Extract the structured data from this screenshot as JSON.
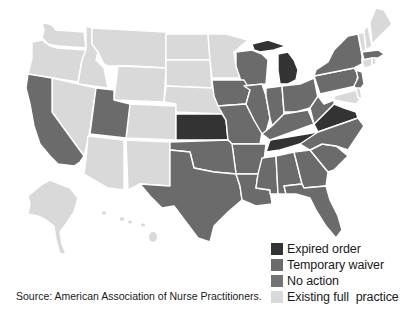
{
  "map": {
    "subject": "Nurse practitioner practice authority by U.S. state",
    "colors": {
      "expired_order": "#333333",
      "temporary_waiver": "#6b6b6b",
      "no_action": "#747474",
      "existing_full_practice": "#d9d9d9",
      "border": "#ffffff"
    },
    "states": {
      "expired_order": [
        "KS",
        "MI",
        "TN",
        "VA"
      ],
      "temporary_waiver": [
        "CA",
        "UT",
        "IL",
        "IN",
        "OH",
        "PA",
        "NY",
        "NJ",
        "MA",
        "WI",
        "IA",
        "MO",
        "AR",
        "OK",
        "TX",
        "LA",
        "MS",
        "AL",
        "GA",
        "FL",
        "SC",
        "NC",
        "KY",
        "WV"
      ],
      "existing_full_practice": [
        "WA",
        "OR",
        "ID",
        "MT",
        "WY",
        "NV",
        "CO",
        "AZ",
        "NM",
        "ND",
        "SD",
        "NE",
        "MN",
        "ME",
        "NH",
        "VT",
        "RI",
        "CT",
        "DE",
        "MD",
        "DC",
        "AK",
        "HI"
      ]
    }
  },
  "legend": {
    "items": [
      {
        "label": "Expired order",
        "color": "#333333"
      },
      {
        "label": "Temporary waiver",
        "color": "#6b6b6b"
      },
      {
        "label": "No action",
        "color": "#747474"
      },
      {
        "label": "Existing full  practice",
        "color": "#d9d9d9"
      }
    ]
  },
  "source": "Source: American Association of Nurse Practitioners."
}
